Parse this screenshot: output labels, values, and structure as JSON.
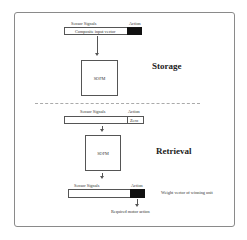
{
  "storage": {
    "title": "Storage",
    "input_vector": {
      "sensor_label": "Sensor Signals",
      "action_label": "Action",
      "content": "Composite input vector",
      "action_fill": "#111111"
    },
    "network_label": "SOFM"
  },
  "retrieval": {
    "title": "Retrieval",
    "input_vector": {
      "sensor_label": "Sensor Signals",
      "action_label": "Action",
      "content": "",
      "action_value": "Zero"
    },
    "network_label": "SOFM",
    "output_vector": {
      "sensor_label": "Sensor Signals",
      "action_label": "Action",
      "action_fill": "#111111",
      "annotation": "Weight vector of winning unit"
    },
    "output_label": "Required motor action"
  },
  "colors": {
    "frame": "#8a8a8a",
    "line": "#555555",
    "separator": "#aaaaaa",
    "fill": "#111111"
  }
}
